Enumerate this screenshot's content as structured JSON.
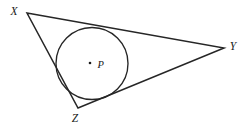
{
  "figure": {
    "background_color": "#ffffff",
    "stroke_color": "#262626",
    "label_color": "#1a1a1a",
    "width": 244,
    "height": 130
  },
  "triangle": {
    "name": "triangle-xyz",
    "vertices": [
      {
        "id": "X",
        "label": "X",
        "x": 27,
        "y": 13,
        "label_x": 14,
        "label_y": 15
      },
      {
        "id": "Y",
        "label": "Y",
        "x": 224,
        "y": 48,
        "label_x": 233,
        "label_y": 50
      },
      {
        "id": "Z",
        "label": "Z",
        "x": 78,
        "y": 108,
        "label_x": 75,
        "label_y": 122
      }
    ],
    "sides": [
      {
        "id": "XY",
        "from": "X",
        "to": "Y"
      },
      {
        "id": "YZ",
        "from": "Y",
        "to": "Z"
      },
      {
        "id": "ZX",
        "from": "Z",
        "to": "X"
      }
    ],
    "path": "M 27 13 L 224 48 L 78 108 Z"
  },
  "incircle": {
    "name": "inscribed-circle",
    "center": {
      "label": "P",
      "x": 92,
      "y": 63.5
    },
    "radius": 36,
    "dot": {
      "x": 90,
      "y": 63,
      "size": 2.6
    },
    "center_label_x": 97.5,
    "center_label_y": 68
  }
}
